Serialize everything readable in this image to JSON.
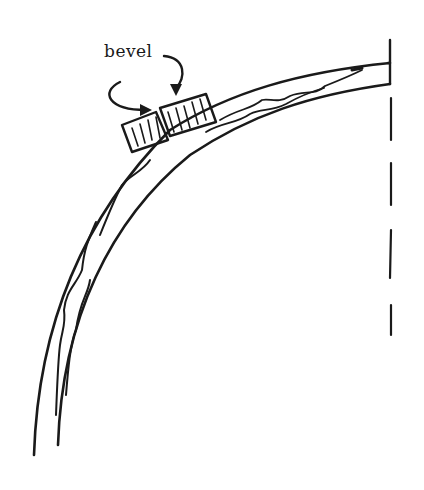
{
  "diagram": {
    "type": "illustration",
    "labels": {
      "bevel": "bevel"
    },
    "elements": [
      "outer-curve",
      "inner-curve",
      "wood-grain-lines",
      "bevel-block-left",
      "bevel-block-right",
      "arrow-left",
      "arrow-right",
      "end-cap",
      "center-dashed-line"
    ],
    "colors": {
      "ink": "#1a1a1a",
      "background": "#ffffff"
    }
  }
}
